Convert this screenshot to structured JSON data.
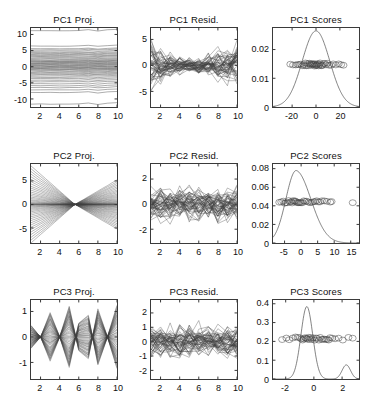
{
  "figure": {
    "width": 371,
    "height": 412,
    "background": "#ffffff",
    "line_color": "#404040",
    "axis_color": "#3a3a3a",
    "rows": 3,
    "cols": 3
  },
  "panels": [
    {
      "id": "pc1-proj",
      "title": "PC1 Proj.",
      "xticks": [
        2,
        4,
        6,
        8,
        10
      ],
      "yticks": [
        -10,
        -5,
        0,
        5,
        10
      ],
      "xlim": [
        1,
        10
      ],
      "ylim": [
        -12.5,
        12.0
      ]
    },
    {
      "id": "pc1-resid",
      "title": "PC1 Resid.",
      "xticks": [
        2,
        4,
        6,
        8,
        10
      ],
      "yticks": [
        -5,
        0,
        5
      ],
      "xlim": [
        1,
        10
      ],
      "ylim": [
        -8.0,
        7.2
      ]
    },
    {
      "id": "pc1-scores",
      "title": "PC1 Scores",
      "xticks": [
        -20,
        0,
        20
      ],
      "yticks": [
        0,
        0.01,
        0.02
      ],
      "xlim": [
        -36,
        36
      ],
      "ylim": [
        0,
        0.0275
      ]
    },
    {
      "id": "pc2-proj",
      "title": "PC2 Proj.",
      "xticks": [
        2,
        4,
        6,
        8,
        10
      ],
      "yticks": [
        -5,
        0,
        5
      ],
      "xlim": [
        1,
        10
      ],
      "ylim": [
        -8.2,
        8.6
      ]
    },
    {
      "id": "pc2-resid",
      "title": "PC2 Resid.",
      "xticks": [
        2,
        4,
        6,
        8,
        10
      ],
      "yticks": [
        -2,
        0,
        2
      ],
      "xlim": [
        1,
        10
      ],
      "ylim": [
        -3.1,
        3.2
      ]
    },
    {
      "id": "pc2-scores",
      "title": "PC2 Scores",
      "xticks": [
        -5,
        0,
        5,
        10,
        15
      ],
      "yticks": [
        0,
        0.02,
        0.04,
        0.06,
        0.08
      ],
      "xlim": [
        -8.5,
        17.5
      ],
      "ylim": [
        0,
        0.085
      ]
    },
    {
      "id": "pc3-proj",
      "title": "PC3 Proj.",
      "xticks": [
        2,
        4,
        6,
        8,
        10
      ],
      "yticks": [
        -1,
        0,
        1
      ],
      "xlim": [
        1,
        10
      ],
      "ylim": [
        -1.65,
        1.45
      ]
    },
    {
      "id": "pc3-resid",
      "title": "PC3 Resid.",
      "xticks": [
        2,
        4,
        6,
        8,
        10
      ],
      "yticks": [
        -2,
        -1,
        0,
        1,
        2
      ],
      "xlim": [
        1,
        10
      ],
      "ylim": [
        -2.6,
        2.9
      ]
    },
    {
      "id": "pc3-scores",
      "title": "PC3 Scores",
      "xticks": [
        -2,
        0,
        2
      ],
      "yticks": [
        0,
        0.1,
        0.2,
        0.3,
        0.4
      ],
      "xlim": [
        -2.9,
        3.2
      ],
      "ylim": [
        0,
        0.42
      ]
    }
  ],
  "chart_data": [
    {
      "id": "pc1-proj",
      "type": "line",
      "title": "PC1 Proj.",
      "xlabel": "",
      "ylabel": "",
      "grid": false,
      "legend": "none",
      "description": "Bundle of ~50 near-horizontal reconstruction curves from the first principal component; each curve is nearly flat across x=1..10 with slight wiggle near x=7-9.",
      "x": [
        1,
        2,
        3,
        4,
        5,
        6,
        7,
        8,
        9,
        10
      ],
      "xlim": [
        1,
        10
      ],
      "ylim": [
        -12.5,
        12.0
      ],
      "xticks": [
        2,
        4,
        6,
        8,
        10
      ],
      "yticks": [
        -10,
        -5,
        0,
        5,
        10
      ],
      "series_offsets": [
        11.2,
        6.4,
        5.6,
        5.2,
        4.8,
        4.4,
        4.1,
        3.8,
        3.5,
        3.2,
        2.9,
        2.6,
        2.3,
        2.0,
        1.8,
        1.6,
        1.4,
        1.2,
        1.0,
        0.8,
        0.6,
        0.4,
        0.2,
        0.0,
        -0.2,
        -0.4,
        -0.6,
        -0.8,
        -1.0,
        -1.3,
        -1.6,
        -1.9,
        -2.2,
        -2.5,
        -2.9,
        -3.3,
        -3.7,
        -4.2,
        -4.7,
        -5.3,
        -5.9,
        -6.5,
        -7.2,
        -8.0,
        -11.6
      ],
      "shape": [
        0.0,
        0.02,
        0.0,
        -0.03,
        0.0,
        0.05,
        0.28,
        -0.12,
        0.18,
        0.35
      ]
    },
    {
      "id": "pc1-resid",
      "type": "line",
      "title": "PC1 Resid.",
      "xlabel": "",
      "ylabel": "",
      "grid": false,
      "legend": "none",
      "description": "Residual curves after removing PC1; spread is wide at x=1 and x=10, pinched narrow near x=5-6, noisy zig-zag traces centred on 0.",
      "x": [
        1,
        2,
        3,
        4,
        5,
        6,
        7,
        8,
        9,
        10
      ],
      "xlim": [
        1,
        10
      ],
      "ylim": [
        -8.0,
        7.2
      ],
      "xticks": [
        2,
        4,
        6,
        8,
        10
      ],
      "yticks": [
        -5,
        0,
        5
      ],
      "envelope": [
        5.5,
        3.0,
        2.3,
        1.8,
        1.4,
        1.5,
        2.2,
        2.8,
        3.4,
        4.2
      ],
      "n_curves": 48
    },
    {
      "id": "pc1-scores",
      "type": "line",
      "title": "PC1 Scores",
      "xlabel": "",
      "ylabel": "",
      "grid": false,
      "legend": "none",
      "description": "Kernel density estimate of PC1 scores: a single broad symmetric bell peaking at about 0.0265 near x=0, with open-circle score markers plotted at y about 0.0148.",
      "xlim": [
        -36,
        36
      ],
      "ylim": [
        0,
        0.0275
      ],
      "xticks": [
        -20,
        0,
        20
      ],
      "yticks": [
        0,
        0.01,
        0.02
      ],
      "density_peak_x": 0,
      "density_peak_y": 0.0265,
      "density_sigma": 11.5,
      "marker_y": 0.0148,
      "marker_style": "open-circle",
      "marker_x": [
        -21.5,
        -19.2,
        -17.0,
        -15.4,
        -14.2,
        -12.8,
        -11.6,
        -10.4,
        -9.6,
        -8.8,
        -8.0,
        -7.2,
        -6.4,
        -5.6,
        -5.0,
        -4.4,
        -3.8,
        -3.2,
        -2.6,
        -2.0,
        -1.5,
        -1.0,
        -0.5,
        0.0,
        0.5,
        1.0,
        1.6,
        2.2,
        2.8,
        3.4,
        4.0,
        4.8,
        5.6,
        6.4,
        7.4,
        8.4,
        9.6,
        11.0,
        12.6,
        14.4,
        16.6,
        19.0,
        21.0,
        23.0
      ]
    },
    {
      "id": "pc2-proj",
      "type": "line",
      "title": "PC2 Proj.",
      "xlabel": "",
      "ylabel": "",
      "grid": false,
      "legend": "none",
      "description": "Bowtie pattern: all PC2 projection curves converge to a node at about x=5.6 and fan out linearly toward both ends, widest at x=1 and x=10.",
      "x": [
        1,
        2,
        3,
        4,
        5,
        6,
        7,
        8,
        9,
        10
      ],
      "xlim": [
        1,
        10
      ],
      "ylim": [
        -8.2,
        8.6
      ],
      "xticks": [
        2,
        4,
        6,
        8,
        10
      ],
      "yticks": [
        -5,
        0,
        5
      ],
      "node_x": 5.6,
      "amp_left": 8.2,
      "amp_right": 5.2,
      "n_curves": 46
    },
    {
      "id": "pc2-resid",
      "type": "line",
      "title": "PC2 Resid.",
      "xlabel": "",
      "ylabel": "",
      "grid": false,
      "legend": "none",
      "description": "Dense noisy residual traces after removing PC2; roughly uniform vertical spread of about plus/minus 2.5 across all x, centred on 0.",
      "x": [
        1,
        2,
        3,
        4,
        5,
        6,
        7,
        8,
        9,
        10
      ],
      "xlim": [
        1,
        10
      ],
      "ylim": [
        -3.1,
        3.2
      ],
      "xticks": [
        2,
        4,
        6,
        8,
        10
      ],
      "yticks": [
        -2,
        0,
        2
      ],
      "spread": 1.25,
      "n_curves": 50
    },
    {
      "id": "pc2-scores",
      "type": "line",
      "title": "PC2 Scores",
      "xlabel": "",
      "ylabel": "",
      "grid": false,
      "legend": "none",
      "description": "Right-skewed kernel density of PC2 scores peaking near 0.078 at x=-1.5, with a long tail to x=15; open-circle markers clustered at y about 0.044.",
      "xlim": [
        -8.5,
        17.5
      ],
      "ylim": [
        0,
        0.085
      ],
      "xticks": [
        -5,
        0,
        5,
        10,
        15
      ],
      "yticks": [
        0,
        0.02,
        0.04,
        0.06,
        0.08
      ],
      "density_peak_x": -1.5,
      "density_peak_y": 0.078,
      "marker_y": 0.0442,
      "marker_style": "open-circle",
      "marker_x": [
        -6.6,
        -6.0,
        -5.4,
        -5.0,
        -4.6,
        -4.2,
        -3.8,
        -3.4,
        -3.0,
        -2.7,
        -2.4,
        -2.1,
        -1.8,
        -1.5,
        -1.2,
        -0.9,
        -0.6,
        -0.3,
        0.0,
        0.4,
        0.8,
        1.2,
        1.7,
        2.2,
        2.7,
        3.2,
        3.7,
        4.2,
        4.7,
        5.2,
        5.7,
        6.3,
        7.0,
        7.8,
        8.8,
        9.2,
        15.6
      ]
    },
    {
      "id": "pc3-proj",
      "type": "line",
      "title": "PC3 Proj.",
      "xlabel": "",
      "ylabel": "",
      "grid": false,
      "legend": "none",
      "description": "Oscillating PC3 projection curves with nodes near x=2, 4, 6.5 and 9 and antinodes near x=3, 5, 7.5 and 10; amplitude envelope about plus/minus 1.4.",
      "x": [
        1,
        2,
        3,
        4,
        5,
        6,
        7,
        8,
        9,
        10
      ],
      "xlim": [
        1,
        10
      ],
      "ylim": [
        -1.65,
        1.45
      ],
      "xticks": [
        2,
        4,
        6,
        8,
        10
      ],
      "yticks": [
        -1,
        0,
        1
      ],
      "nodes": [
        2,
        4,
        6.5,
        9
      ],
      "shape": [
        0.45,
        0.0,
        0.95,
        0.0,
        -1.2,
        0.55,
        0.85,
        -1.1,
        0.0,
        1.25
      ],
      "n_curves": 44
    },
    {
      "id": "pc3-resid",
      "type": "line",
      "title": "PC3 Resid.",
      "xlabel": "",
      "ylabel": "",
      "grid": false,
      "legend": "none",
      "description": "Dense noisy residual traces after removing PC3; near-uniform vertical spread of about plus/minus 2.2, centred on 0.",
      "x": [
        1,
        2,
        3,
        4,
        5,
        6,
        7,
        8,
        9,
        10
      ],
      "xlim": [
        1,
        10
      ],
      "ylim": [
        -2.6,
        2.9
      ],
      "xticks": [
        2,
        4,
        6,
        8,
        10
      ],
      "yticks": [
        -2,
        -1,
        0,
        1,
        2
      ],
      "spread": 1.1,
      "n_curves": 50
    },
    {
      "id": "pc3-scores",
      "type": "line",
      "title": "PC3 Scores",
      "xlabel": "",
      "ylabel": "",
      "grid": false,
      "legend": "none",
      "description": "Bimodal kernel density of PC3 scores: tall narrow main peak of about 0.385 at x=-0.5 and a small secondary bump of about 0.075 near x=2.3; open-circle markers at y about 0.215.",
      "xlim": [
        -2.9,
        3.2
      ],
      "ylim": [
        0,
        0.42
      ],
      "xticks": [
        -2,
        0,
        2
      ],
      "yticks": [
        0,
        0.1,
        0.2,
        0.3,
        0.4
      ],
      "peaks": [
        {
          "x": -0.5,
          "y": 0.385,
          "sigma": 0.42
        },
        {
          "x": 2.3,
          "y": 0.075,
          "sigma": 0.3
        }
      ],
      "marker_y": 0.215,
      "marker_style": "open-circle",
      "marker_x": [
        -2.25,
        -1.95,
        -1.75,
        -1.5,
        -1.3,
        -1.15,
        -1.0,
        -0.9,
        -0.8,
        -0.72,
        -0.64,
        -0.56,
        -0.5,
        -0.44,
        -0.38,
        -0.3,
        -0.22,
        -0.14,
        -0.05,
        0.05,
        0.15,
        0.25,
        0.35,
        0.45,
        0.55,
        0.65,
        0.75,
        0.85,
        0.95,
        1.05,
        1.15,
        1.3,
        1.5,
        1.75,
        2.05,
        2.45,
        2.75
      ]
    }
  ]
}
